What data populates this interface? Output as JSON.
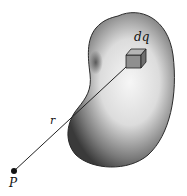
{
  "diagram": {
    "labels": {
      "element": "dq",
      "distance": "r",
      "point": "P"
    },
    "colors": {
      "body_dark": "#3a3a3a",
      "body_light": "#f4f4f4",
      "cube_face": "#8a8a8a",
      "line": "#222222"
    }
  }
}
